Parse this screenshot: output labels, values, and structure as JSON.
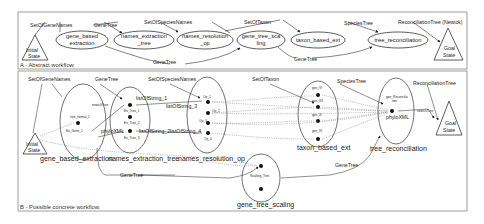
{
  "panel_a": {
    "caption": "A - Abstract workflow",
    "initial_state": [
      "Initial",
      "State"
    ],
    "goal_state": [
      "Goal",
      "State"
    ],
    "nodes": [
      {
        "line1": "gene_based",
        "line2": "extraction"
      },
      {
        "line1": "names_extraction",
        "line2": "_tree"
      },
      {
        "line1": "names_resolution",
        "line2": "_op"
      },
      {
        "line1": "gene_tree_sca",
        "line2": "ling"
      },
      {
        "line1": "taxon_based_ext",
        "line2": ""
      },
      {
        "line1": "tree_reconciliation",
        "line2": ""
      }
    ],
    "edge_labels": {
      "set_of_gene_names": "SetOfGeneNames",
      "gene_tree_1": "GeneTree",
      "set_of_species_names": "SetOfSpeciesNames",
      "set_of_taxon": "SetOfTaxon",
      "species_tree": "SpeciesTree",
      "reconciliation_tree": "ReconciliationTree (Newick)",
      "gene_tree_bottom_1": "GeneTree",
      "gene_tree_bottom_2": "GeneTree"
    }
  },
  "panel_b": {
    "caption": "B - Possible concrete workflow.",
    "initial_state": [
      "Initial",
      "State"
    ],
    "goal_state": [
      "Goal",
      "State"
    ],
    "services": {
      "gene_based_extraction": "gene_based_extraction",
      "names_extraction_tree": "names_extraction_tree",
      "names_resolution_op": "names_resolution_op",
      "taxon_based_ext": "taxon_based_ext",
      "tree_reconciliation": "tree_reconciliation",
      "gene_tree_scaling": "gene_tree_scaling"
    },
    "edge_labels": {
      "set_of_gene_names": "SetOfGeneNames",
      "gene_tree": "GeneTree",
      "set_of_species_names": "SetOfSpeciesNames",
      "set_of_taxon": "SetOfTaxon",
      "species_tree": "SpeciesTree",
      "reconciliation_tree": "ReconciliationTree",
      "newick_tree_1": "newickTree",
      "newick_tree_2": "newickTree",
      "phylo_xml_1": "phyloXML",
      "phylo_xml_2": "phyloXML",
      "list_of_string_1": "listOfString_1",
      "list_of_string_2": "listOfString_2",
      "list_of_string_3": "listOfString_3",
      "list_of_string_4": "listOfString_4",
      "gene_tree_bottom": "GeneTree",
      "gene_tree_scaling_out": "GeneTree",
      "tree_format": "tree_format_1"
    },
    "ops": {
      "ex_gene_1": "Ex_Gene_1",
      "ex_tree_1": "Ex_Tree_1",
      "ex_tree_2": "Ex_Tree_2",
      "ex_tree_3": "Ex_Tree_3",
      "op_1": "Op_1",
      "op_2": "Op_2",
      "op_3": "Op_3",
      "op_4": "Op_4",
      "gen_vi": "gen_VI",
      "gen_vii": "gen_VII",
      "gen_iii": "gen_III",
      "gen_iv": "gen_IV",
      "gen_reconciliation": "gen_Reconcilia",
      "gen_reconciliation_2": "tion",
      "scaling_tree": "Scalling_Tree"
    }
  }
}
